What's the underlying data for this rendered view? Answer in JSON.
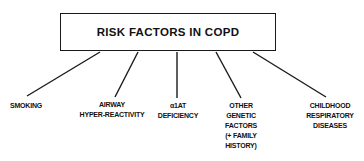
{
  "diagram": {
    "title": "RISK FACTORS IN COPD",
    "factors": [
      {
        "label": "SMOKING"
      },
      {
        "label": "AIRWAY\nHYPER-REACTIVITY"
      },
      {
        "label": "α1AT\nDEFICIENCY"
      },
      {
        "label": "OTHER\nGENETIC\nFACTORS\n(+ FAMILY\nHISTORY)"
      },
      {
        "label": "CHILDHOOD\nRESPIRATORY\nDISEASES"
      }
    ]
  }
}
